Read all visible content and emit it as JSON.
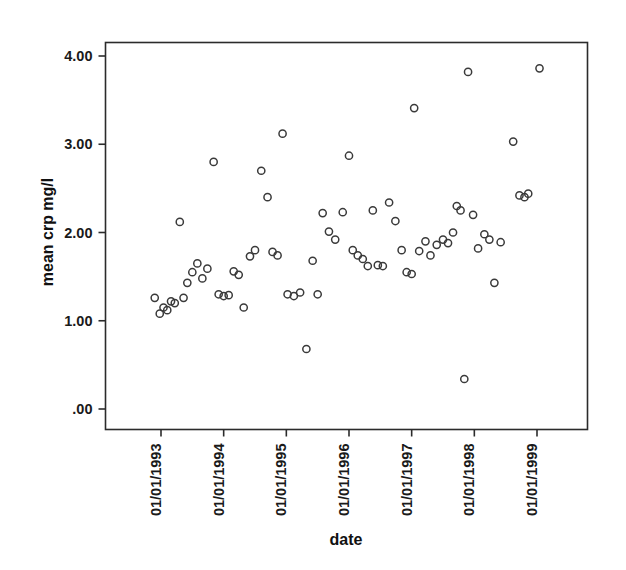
{
  "chart_data": {
    "type": "scatter",
    "title": "",
    "xlabel": "date",
    "ylabel": "mean crp mg/l",
    "grid": false,
    "legend": false,
    "legend_position": "none",
    "marker": "open-circle",
    "marker_color": "#3a3a3a",
    "frame_color": "#2b2b2b",
    "background_color": "#ffffff",
    "xtick_rotation": -90,
    "ylim": [
      0.0,
      4.2
    ],
    "ytick_labels": [
      "4.00",
      "3.00",
      "2.00",
      "1.00",
      ".00"
    ],
    "ytick_values": [
      4.0,
      3.0,
      2.0,
      1.0,
      0.0
    ],
    "xtick_labels": [
      "01/01/1993",
      "01/01/1994",
      "01/01/1995",
      "01/01/1996",
      "01/01/1997",
      "01/01/1998",
      "01/01/1999"
    ],
    "xtick_values": [
      1993.0,
      1994.0,
      1995.0,
      1996.0,
      1997.0,
      1998.0,
      1999.0
    ],
    "xlim": [
      1992.1,
      1999.9
    ],
    "points": [
      {
        "x": 1992.9,
        "y": 1.26
      },
      {
        "x": 1992.98,
        "y": 1.08
      },
      {
        "x": 1993.04,
        "y": 1.15
      },
      {
        "x": 1993.1,
        "y": 1.12
      },
      {
        "x": 1993.16,
        "y": 1.22
      },
      {
        "x": 1993.22,
        "y": 1.2
      },
      {
        "x": 1993.3,
        "y": 2.12
      },
      {
        "x": 1993.36,
        "y": 1.26
      },
      {
        "x": 1993.42,
        "y": 1.43
      },
      {
        "x": 1993.5,
        "y": 1.55
      },
      {
        "x": 1993.58,
        "y": 1.65
      },
      {
        "x": 1993.66,
        "y": 1.48
      },
      {
        "x": 1993.74,
        "y": 1.59
      },
      {
        "x": 1993.84,
        "y": 2.8
      },
      {
        "x": 1993.92,
        "y": 1.3
      },
      {
        "x": 1994.0,
        "y": 1.28
      },
      {
        "x": 1994.08,
        "y": 1.29
      },
      {
        "x": 1994.16,
        "y": 1.56
      },
      {
        "x": 1994.24,
        "y": 1.52
      },
      {
        "x": 1994.32,
        "y": 1.15
      },
      {
        "x": 1994.42,
        "y": 1.73
      },
      {
        "x": 1994.5,
        "y": 1.8
      },
      {
        "x": 1994.6,
        "y": 2.7
      },
      {
        "x": 1994.7,
        "y": 2.4
      },
      {
        "x": 1994.78,
        "y": 1.78
      },
      {
        "x": 1994.86,
        "y": 1.74
      },
      {
        "x": 1994.94,
        "y": 3.12
      },
      {
        "x": 1995.02,
        "y": 1.3
      },
      {
        "x": 1995.12,
        "y": 1.28
      },
      {
        "x": 1995.22,
        "y": 1.32
      },
      {
        "x": 1995.32,
        "y": 0.68
      },
      {
        "x": 1995.42,
        "y": 1.68
      },
      {
        "x": 1995.5,
        "y": 1.3
      },
      {
        "x": 1995.58,
        "y": 2.22
      },
      {
        "x": 1995.68,
        "y": 2.01
      },
      {
        "x": 1995.78,
        "y": 1.92
      },
      {
        "x": 1995.9,
        "y": 2.23
      },
      {
        "x": 1996.0,
        "y": 2.87
      },
      {
        "x": 1996.06,
        "y": 1.8
      },
      {
        "x": 1996.14,
        "y": 1.74
      },
      {
        "x": 1996.22,
        "y": 1.7
      },
      {
        "x": 1996.3,
        "y": 1.62
      },
      {
        "x": 1996.38,
        "y": 2.25
      },
      {
        "x": 1996.46,
        "y": 1.63
      },
      {
        "x": 1996.54,
        "y": 1.62
      },
      {
        "x": 1996.64,
        "y": 2.34
      },
      {
        "x": 1996.74,
        "y": 2.13
      },
      {
        "x": 1996.84,
        "y": 1.8
      },
      {
        "x": 1996.92,
        "y": 1.55
      },
      {
        "x": 1997.0,
        "y": 1.53
      },
      {
        "x": 1997.04,
        "y": 3.41
      },
      {
        "x": 1997.12,
        "y": 1.79
      },
      {
        "x": 1997.22,
        "y": 1.9
      },
      {
        "x": 1997.3,
        "y": 1.74
      },
      {
        "x": 1997.4,
        "y": 1.86
      },
      {
        "x": 1997.5,
        "y": 1.92
      },
      {
        "x": 1997.58,
        "y": 1.88
      },
      {
        "x": 1997.66,
        "y": 2.0
      },
      {
        "x": 1997.72,
        "y": 2.3
      },
      {
        "x": 1997.78,
        "y": 2.25
      },
      {
        "x": 1997.84,
        "y": 0.34
      },
      {
        "x": 1997.9,
        "y": 3.82
      },
      {
        "x": 1997.98,
        "y": 2.2
      },
      {
        "x": 1998.06,
        "y": 1.82
      },
      {
        "x": 1998.16,
        "y": 1.98
      },
      {
        "x": 1998.24,
        "y": 1.92
      },
      {
        "x": 1998.32,
        "y": 1.43
      },
      {
        "x": 1998.42,
        "y": 1.89
      },
      {
        "x": 1998.62,
        "y": 3.03
      },
      {
        "x": 1998.72,
        "y": 2.42
      },
      {
        "x": 1998.8,
        "y": 2.4
      },
      {
        "x": 1998.86,
        "y": 2.44
      },
      {
        "x": 1999.04,
        "y": 3.86
      }
    ]
  }
}
